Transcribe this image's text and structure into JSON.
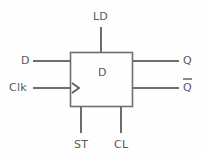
{
  "diagram": {
    "colors": {
      "background": "#fefefe",
      "line": "#6e6e6e",
      "text": "#59595b"
    },
    "body": {
      "core_label": "D"
    },
    "inputs": [
      {
        "id": "ld",
        "label": "LD",
        "side": "top"
      },
      {
        "id": "d",
        "label": "D",
        "side": "left"
      },
      {
        "id": "clk",
        "label": "Clk",
        "side": "left",
        "marker": "clock-triangle-icon"
      },
      {
        "id": "st",
        "label": "ST",
        "side": "bottom"
      },
      {
        "id": "cl",
        "label": "CL",
        "side": "bottom"
      }
    ],
    "outputs": [
      {
        "id": "q",
        "label": "Q",
        "side": "right",
        "overbar": false
      },
      {
        "id": "qbar",
        "label": "Q",
        "side": "right",
        "overbar": true
      }
    ]
  }
}
